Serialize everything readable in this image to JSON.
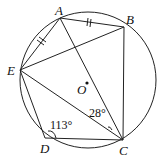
{
  "diagram": {
    "type": "inscribed-pentagon-circle",
    "points": {
      "A": {
        "label": "A",
        "x": 60,
        "y": 18
      },
      "B": {
        "label": "B",
        "x": 124,
        "y": 27
      },
      "C": {
        "label": "C",
        "x": 123,
        "y": 140
      },
      "D": {
        "label": "D",
        "x": 45,
        "y": 138
      },
      "E": {
        "label": "E",
        "x": 20,
        "y": 70
      },
      "O": {
        "label": "O",
        "x": 87,
        "y": 83
      }
    },
    "angles": {
      "ACE": "28°",
      "EDC": "113°"
    },
    "equal_marks": [
      "AB",
      "AE"
    ]
  }
}
